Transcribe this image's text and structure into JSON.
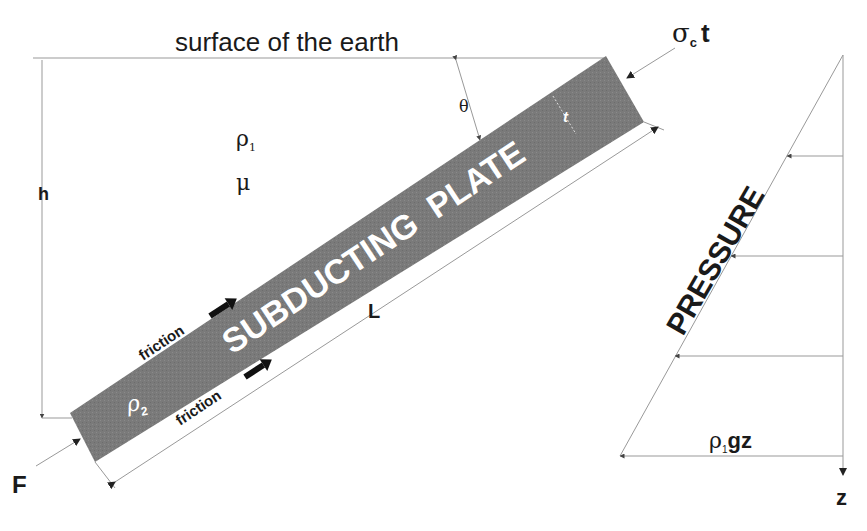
{
  "labels": {
    "surface": "surface of the earth",
    "rho1": "ρ",
    "rho1_sub": "1",
    "mu": "μ",
    "h": "h",
    "theta": "θ",
    "t": "t",
    "sigma": "σ",
    "sigma_sub": "c",
    "sigma_t": "t",
    "plate": "SUBDUCTING  PLATE",
    "rho2": "ρ",
    "rho2_sub": "2",
    "friction_top": "friction",
    "friction_bottom": "friction",
    "L": "L",
    "F": "F",
    "pressure": "PRESSURE",
    "rhogz_rho": "ρ",
    "rhogz_sub": "1",
    "rhogz_rest": "gz",
    "z": "z"
  },
  "colors": {
    "plate": "#7a7a7a",
    "line": "#9a9a9a",
    "text": "#1a1a1a",
    "plate_text": "#ffffff"
  }
}
